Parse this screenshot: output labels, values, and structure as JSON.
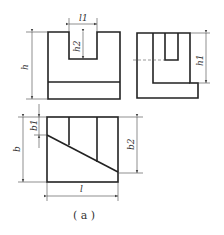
{
  "figure": {
    "caption": "( a )",
    "views": [
      "front-view",
      "side-view",
      "top-view"
    ]
  },
  "dimensions": {
    "l1": "l1",
    "h2": "h2",
    "h": "h",
    "h1": "h1",
    "b": "b",
    "b1": "b1",
    "b2": "b2",
    "l": "l"
  },
  "colors": {
    "line": "#222222",
    "background": "#ffffff"
  }
}
